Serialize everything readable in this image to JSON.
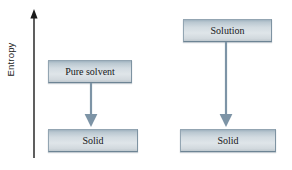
{
  "figure": {
    "axis": {
      "label": "Entropy",
      "direction": "up",
      "arrow_color": "#1a1a1a"
    },
    "arrow_color": "#7d94a6",
    "box_border_color": "#93a5b2",
    "text_color": "#17181a",
    "columns": [
      {
        "id": "pure-solvent-column",
        "nodes": [
          {
            "id": "pure-solvent",
            "label": "Pure solvent"
          },
          {
            "id": "solid-left",
            "label": "Solid"
          }
        ],
        "arrow": {
          "from": "pure-solvent",
          "to": "solid-left"
        }
      },
      {
        "id": "solution-column",
        "nodes": [
          {
            "id": "solution",
            "label": "Solution"
          },
          {
            "id": "solid-right",
            "label": "Solid"
          }
        ],
        "arrow": {
          "from": "solution",
          "to": "solid-right"
        }
      }
    ]
  }
}
